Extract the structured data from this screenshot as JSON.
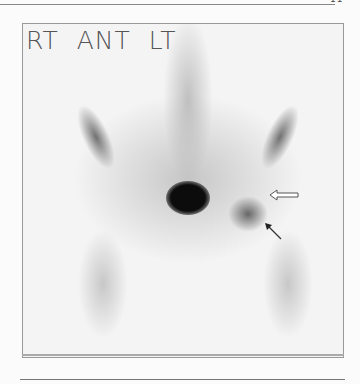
{
  "page": {
    "page_number": "11"
  },
  "figure": {
    "view_label": "RT  ANT  LT",
    "labels": {
      "right": "RT",
      "view": "ANT",
      "left": "LT"
    },
    "annotations": [
      {
        "type": "open-arrow",
        "direction": "left"
      },
      {
        "type": "solid-arrow",
        "direction": "up-left"
      }
    ],
    "colors": {
      "background": "#f4f4f4",
      "uptake_dark": "#111111",
      "uptake_mid": "#9a9a9a",
      "label": "#555555"
    }
  }
}
